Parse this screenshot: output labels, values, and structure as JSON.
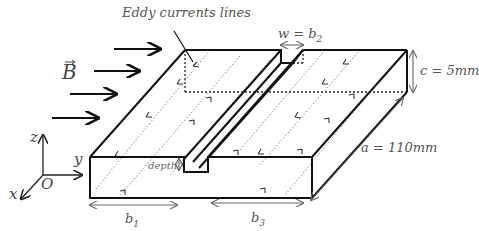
{
  "figure": {
    "title_label": "Eddy currents lines",
    "field_label": "B",
    "field_arrow_count": 4,
    "dimensions": {
      "slot_width": {
        "text": "w = b",
        "sub": "2"
      },
      "thickness": {
        "text": "c = 5mm"
      },
      "length": {
        "text": "a = 110mm"
      },
      "left_width": {
        "text": "b",
        "sub": "1"
      },
      "right_width": {
        "text": "b",
        "sub": "3"
      },
      "slot_depth": {
        "text": "depth"
      }
    },
    "axes": {
      "z": "z",
      "y": "y",
      "x": "x",
      "origin": "O"
    },
    "colors": {
      "outline": "#111111",
      "dim_line": "#666666",
      "text": "#555555",
      "dotted": "#777777"
    }
  }
}
